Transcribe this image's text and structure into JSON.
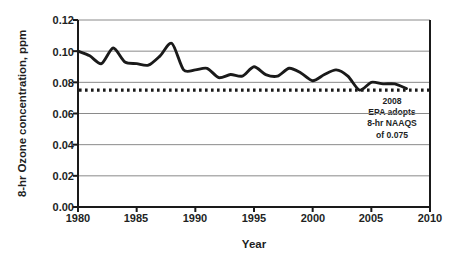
{
  "chart_data": {
    "type": "line",
    "title": "",
    "xlabel": "Year",
    "ylabel": "8-hr Ozone concentration, ppm",
    "xlim": [
      1980,
      2010
    ],
    "ylim": [
      0.0,
      0.12
    ],
    "grid": true,
    "legend": "none",
    "x_ticks": [
      "1980",
      "1985",
      "1990",
      "1995",
      "2000",
      "2005",
      "2010"
    ],
    "x_tick_values": [
      1980,
      1985,
      1990,
      1995,
      2000,
      2005,
      2010
    ],
    "y_ticks": [
      "0.00",
      "0.02",
      "0.04",
      "0.06",
      "0.08",
      "0.10",
      "0.12"
    ],
    "y_tick_values": [
      0.0,
      0.02,
      0.04,
      0.06,
      0.08,
      0.1,
      0.12
    ],
    "series": [
      {
        "name": "8-hr Ozone concentration",
        "x": [
          1980,
          1981,
          1982,
          1983,
          1984,
          1985,
          1986,
          1987,
          1988,
          1989,
          1990,
          1991,
          1992,
          1993,
          1994,
          1995,
          1996,
          1997,
          1998,
          1999,
          2000,
          2001,
          2002,
          2003,
          2004,
          2005,
          2006,
          2007,
          2008
        ],
        "values": [
          0.1,
          0.097,
          0.092,
          0.102,
          0.093,
          0.092,
          0.091,
          0.097,
          0.105,
          0.088,
          0.088,
          0.089,
          0.083,
          0.085,
          0.084,
          0.09,
          0.085,
          0.084,
          0.089,
          0.086,
          0.081,
          0.085,
          0.088,
          0.084,
          0.075,
          0.08,
          0.079,
          0.079,
          0.076
        ]
      }
    ],
    "reference_line": {
      "label": "8-hr NAAQS",
      "value": 0.075,
      "style": "dotted"
    },
    "annotations": [
      {
        "lines": [
          "2008",
          "EPA adopts",
          "8-hr NAAQS",
          "of 0.075"
        ]
      }
    ]
  },
  "colors": {
    "line": "#1a1a1a",
    "grid": "#8a8a8a",
    "axis": "#1a1a1a",
    "text": "#221f1f",
    "background": "#ffffff"
  }
}
